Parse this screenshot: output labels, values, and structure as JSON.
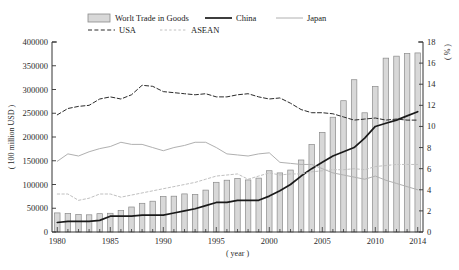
{
  "chart_data": {
    "type": "bar",
    "title": "",
    "xlabel": "( year )",
    "ylabel": "( 100 million USD )",
    "y2label": "( % )",
    "ylim": [
      0,
      400000
    ],
    "y2lim": [
      0,
      18
    ],
    "xlim": [
      1980,
      2014
    ],
    "grid": false,
    "legend_position": "top",
    "y_ticks": [
      "0",
      "50000",
      "100000",
      "150000",
      "200000",
      "250000",
      "300000",
      "350000",
      "400000"
    ],
    "y_tick_values": [
      0,
      50000,
      100000,
      150000,
      200000,
      250000,
      300000,
      350000,
      400000
    ],
    "y2_ticks": [
      "0",
      "2",
      "4",
      "6",
      "8",
      "10",
      "12",
      "14",
      "16",
      "18"
    ],
    "y2_tick_values": [
      0,
      2,
      4,
      6,
      8,
      10,
      12,
      14,
      16,
      18
    ],
    "x_ticks": [
      "1980",
      "1985",
      "1990",
      "1995",
      "2000",
      "2005",
      "2010",
      "2014"
    ],
    "x_tick_values": [
      1980,
      1985,
      1990,
      1995,
      2000,
      2005,
      2010,
      2014
    ],
    "years": [
      1980,
      1981,
      1982,
      1983,
      1984,
      1985,
      1986,
      1987,
      1988,
      1989,
      1990,
      1991,
      1992,
      1993,
      1994,
      1995,
      1996,
      1997,
      1998,
      1999,
      2000,
      2001,
      2002,
      2003,
      2004,
      2005,
      2006,
      2007,
      2008,
      2009,
      2010,
      2011,
      2012,
      2013,
      2014
    ],
    "bars": {
      "name": "Worlt Trade in Goods",
      "axis": "left",
      "color": "#d8d8d8",
      "edge_color": "#8a8a8a",
      "values": [
        40200,
        39200,
        36800,
        36200,
        38600,
        39400,
        45000,
        52600,
        60400,
        64800,
        74600,
        75400,
        80200,
        79000,
        88200,
        104600,
        109000,
        112800,
        109600,
        113400,
        129000,
        124400,
        130400,
        151600,
        184000,
        209800,
        241600,
        276400,
        320600,
        251000,
        306400,
        366000,
        370200,
        375600,
        377000
      ]
    },
    "series": [
      {
        "name": "China",
        "axis": "right",
        "style": "solid-thick",
        "color": "#1a1a1a",
        "values": [
          0.9,
          1.0,
          1.0,
          1.0,
          1.1,
          1.5,
          1.5,
          1.5,
          1.6,
          1.6,
          1.6,
          1.8,
          2.0,
          2.2,
          2.5,
          2.8,
          2.8,
          3.0,
          3.0,
          3.0,
          3.4,
          3.9,
          4.5,
          5.3,
          6.0,
          6.6,
          7.2,
          7.6,
          8.0,
          8.9,
          10.0,
          10.3,
          10.6,
          11.0,
          11.4
        ]
      },
      {
        "name": "Japan",
        "axis": "right",
        "style": "solid-thin",
        "color": "#b0b0b0",
        "values": [
          6.7,
          7.4,
          7.2,
          7.6,
          7.9,
          8.1,
          8.5,
          8.3,
          8.3,
          8.0,
          7.7,
          8.0,
          8.2,
          8.5,
          8.5,
          8.0,
          7.4,
          7.3,
          7.2,
          7.4,
          7.5,
          6.6,
          6.5,
          6.4,
          6.4,
          6.0,
          5.6,
          5.4,
          5.2,
          5.0,
          5.3,
          4.9,
          4.6,
          4.3,
          4.0
        ]
      },
      {
        "name": "USA",
        "axis": "right",
        "style": "dashed",
        "color": "#2b2b2b",
        "values": [
          11.1,
          11.7,
          11.9,
          12.0,
          12.6,
          12.8,
          12.6,
          13.0,
          13.9,
          13.8,
          13.3,
          13.2,
          13.1,
          13.0,
          13.1,
          12.8,
          12.8,
          13.0,
          13.1,
          12.8,
          12.6,
          12.7,
          12.2,
          11.6,
          11.3,
          11.3,
          11.2,
          10.9,
          10.6,
          10.7,
          10.8,
          10.6,
          10.7,
          10.6,
          10.6
        ]
      },
      {
        "name": "ASEAN",
        "axis": "right",
        "style": "dotted",
        "color": "#c0c0c0",
        "values": [
          3.6,
          3.6,
          3.0,
          3.2,
          3.6,
          3.6,
          3.3,
          3.5,
          3.7,
          3.9,
          4.1,
          4.3,
          4.5,
          4.7,
          5.0,
          5.3,
          5.4,
          5.5,
          5.0,
          5.3,
          5.6,
          5.4,
          5.5,
          5.5,
          5.7,
          5.8,
          5.9,
          5.9,
          6.0,
          5.9,
          6.2,
          6.3,
          6.4,
          6.4,
          6.4
        ]
      }
    ],
    "legend": [
      {
        "label": "Worlt Trade in Goods",
        "type": "bar"
      },
      {
        "label": "China",
        "type": "solid-thick"
      },
      {
        "label": "Japan",
        "type": "solid-thin"
      },
      {
        "label": "USA",
        "type": "dashed"
      },
      {
        "label": "ASEAN",
        "type": "dotted"
      }
    ]
  }
}
